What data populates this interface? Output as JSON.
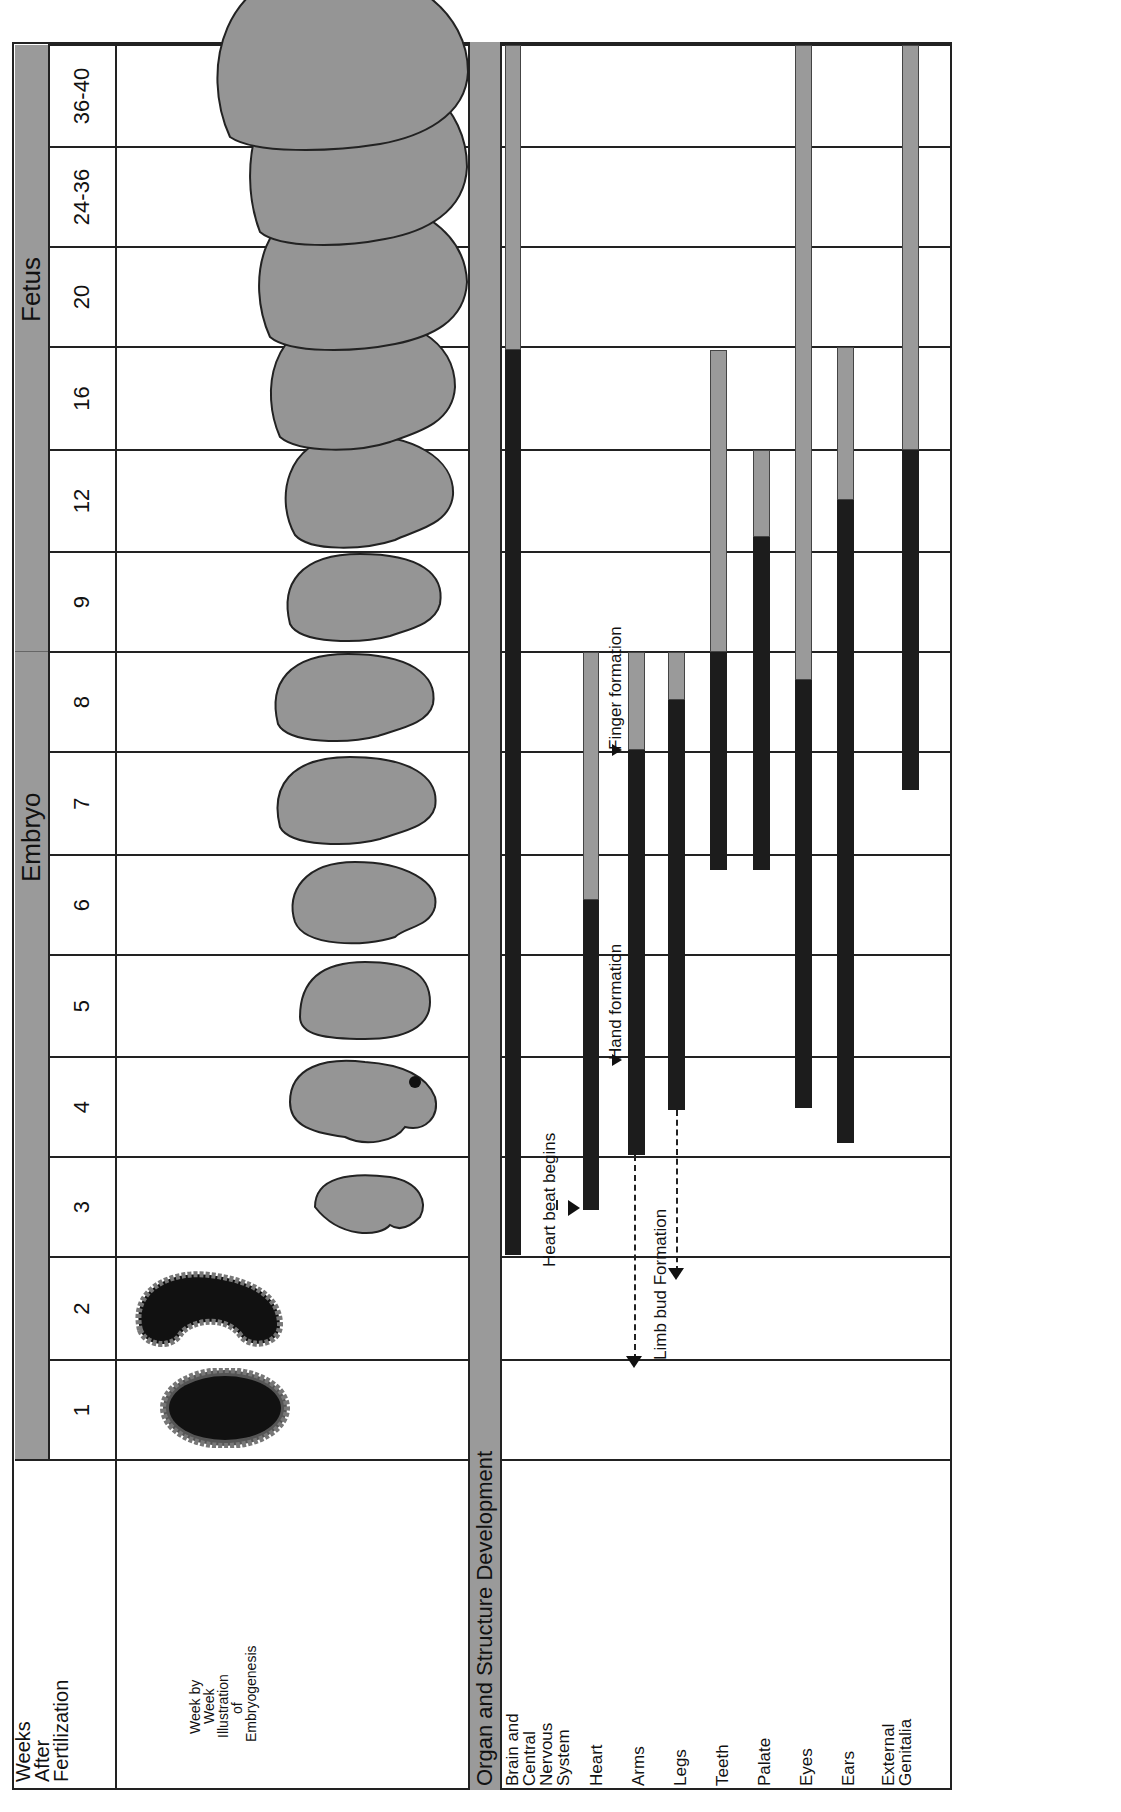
{
  "header": {
    "weeks_label": "Weeks After Fertilization",
    "weeks_label_lines": [
      "Weeks",
      "After",
      "Fertilization"
    ],
    "illustration_label_lines": [
      "Week by",
      "Week",
      "Illustration",
      "of",
      "Embryogenesis"
    ],
    "stages": [
      {
        "name": "Embryo",
        "span": "1-8"
      },
      {
        "name": "Fetus",
        "span": "9-40"
      }
    ]
  },
  "weeks": [
    "1",
    "2",
    "3",
    "4",
    "5",
    "6",
    "7",
    "8",
    "9",
    "12",
    "16",
    "20",
    "24-36",
    "36-40"
  ],
  "organ_section": {
    "title": "Organ and Structure Development",
    "rows": [
      {
        "label_lines": [
          "Brain and",
          "Central",
          "Nervous",
          "System"
        ]
      },
      {
        "label_lines": [
          "Heart"
        ]
      },
      {
        "label_lines": [
          "Arms"
        ]
      },
      {
        "label_lines": [
          "Legs"
        ]
      },
      {
        "label_lines": [
          "Teeth"
        ]
      },
      {
        "label_lines": [
          "Palate"
        ]
      },
      {
        "label_lines": [
          "Eyes"
        ]
      },
      {
        "label_lines": [
          "Ears"
        ]
      },
      {
        "label_lines": [
          "External",
          "Genitalia"
        ]
      }
    ]
  },
  "annotations": {
    "heart_beat": "Heart beat begins",
    "limb_bud": "Limb bud Formation",
    "hand": "Hand formation",
    "finger": "Finger formation"
  },
  "colors": {
    "critical_period": "#1c1c1c",
    "less_sensitive_period": "#9a9a9a",
    "stage_band": "#9a9a9a",
    "illustration_fill": "#8f8f8f"
  },
  "chart_data": {
    "type": "gantt",
    "title": "Organ and Structure Development",
    "xlabel": "Weeks After Fertilization",
    "categories": [
      "1",
      "2",
      "3",
      "4",
      "5",
      "6",
      "7",
      "8",
      "9",
      "12",
      "16",
      "20",
      "24-36",
      "36-40"
    ],
    "stages": [
      {
        "name": "Embryo",
        "weeks": [
          "1",
          "8"
        ]
      },
      {
        "name": "Fetus",
        "weeks": [
          "9",
          "36-40"
        ]
      }
    ],
    "legend_note": "Black = highly sensitive (major) development period; Gray = less sensitive (minor) period",
    "series": [
      {
        "name": "Brain and Central Nervous System",
        "dark": [
          "week 3 (start)",
          "week 16 (start)"
        ],
        "gray": [
          "week 16",
          "week 40 (end)"
        ]
      },
      {
        "name": "Heart",
        "dark": [
          "mid week 3",
          "mid week 6"
        ],
        "gray": [
          "mid week 6",
          "end week 8"
        ]
      },
      {
        "name": "Arms",
        "dark": [
          "end week 3",
          "mid week 7"
        ],
        "gray": [
          "mid week 7",
          "end week 8"
        ]
      },
      {
        "name": "Legs",
        "dark": [
          "mid week 4",
          "late week 8"
        ],
        "gray": [
          "late week 8",
          "end week 8"
        ]
      },
      {
        "name": "Teeth",
        "dark": [
          "week 6 (mid)",
          "end week 8"
        ],
        "gray": [
          "week 9",
          "end week 16 (start)"
        ]
      },
      {
        "name": "Palate",
        "dark": [
          "week 6 (mid)",
          "week 12 (mid)"
        ],
        "gray": [
          "week 12 (mid)",
          "end week 12"
        ]
      },
      {
        "name": "Eyes",
        "dark": [
          "mid week 4",
          "week 8 (end)"
        ],
        "gray": [
          "week 9",
          "week 40 (end)"
        ]
      },
      {
        "name": "Ears",
        "dark": [
          "week 4 (early)",
          "week 12 (mid)"
        ],
        "gray": [
          "week 12 (mid)",
          "end week 16"
        ]
      },
      {
        "name": "External Genitalia",
        "dark": [
          "mid week 7",
          "end week 12"
        ],
        "gray": [
          "week 16",
          "week 40 (end)"
        ]
      }
    ],
    "annotations": [
      {
        "text": "Heart beat begins",
        "at": "mid week 3 (Heart)"
      },
      {
        "text": "Limb bud Formation",
        "at": "week 2-4 (Arms, Legs)"
      },
      {
        "text": "Hand formation",
        "at": "week 5 (Arms)"
      },
      {
        "text": "Finger formation",
        "at": "week 8 (Arms)"
      }
    ]
  }
}
